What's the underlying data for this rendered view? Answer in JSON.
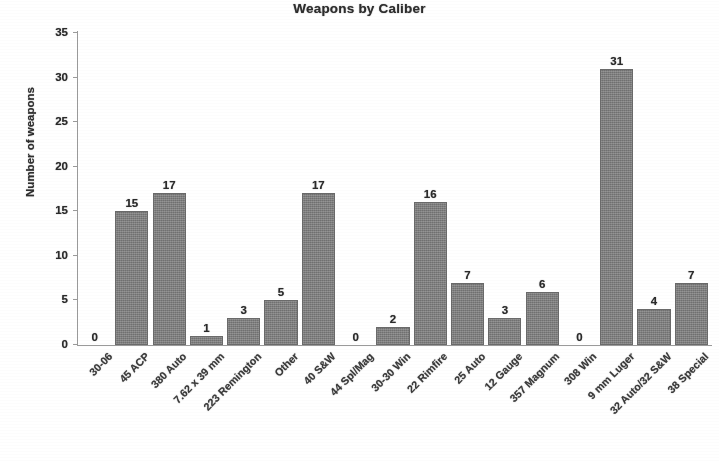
{
  "chart_data": {
    "type": "bar",
    "title": "Weapons by Caliber",
    "xlabel": "",
    "ylabel": "Number of weapons",
    "ylim": [
      0,
      35
    ],
    "ytick_step": 5,
    "yticks": [
      0,
      5,
      10,
      15,
      20,
      25,
      30,
      35
    ],
    "ytick_labels": [
      "0",
      "5",
      "10",
      "15",
      "20",
      "25",
      "30",
      "35"
    ],
    "grid": false,
    "legend": false,
    "data_labels": true,
    "bar_color": "#7f7f7f",
    "categories": [
      "30-06",
      "45 ACP",
      "380 Auto",
      "7.62 x 39 mm",
      "223 Remington",
      "Other",
      "40 S&W",
      "44 Spl/Mag",
      "30-30 Win",
      "22 Rimfire",
      "25 Auto",
      "12 Gauge",
      "357 Magnum",
      "308 Win",
      "9 mm Luger",
      "32 Auto/32 S&W",
      "38 Special"
    ],
    "values": [
      0,
      15,
      17,
      1,
      3,
      5,
      17,
      0,
      2,
      16,
      7,
      3,
      6,
      0,
      31,
      4,
      7
    ],
    "value_labels": [
      "0",
      "15",
      "17",
      "1",
      "3",
      "5",
      "17",
      "0",
      "2",
      "16",
      "7",
      "3",
      "6",
      "0",
      "31",
      "4",
      "7"
    ]
  }
}
